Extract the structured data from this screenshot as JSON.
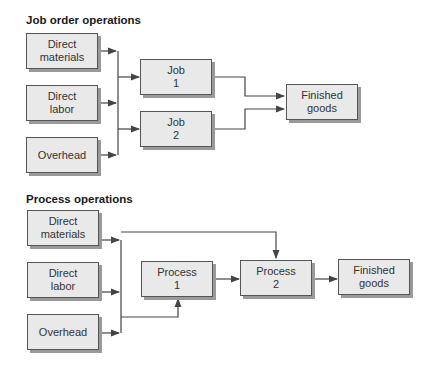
{
  "job_order": {
    "title": "Job order operations",
    "inputs": [
      {
        "line1": "Direct",
        "line2": "materials"
      },
      {
        "line1": "Direct",
        "line2": "labor"
      },
      {
        "line1": "Overhead",
        "line2": ""
      }
    ],
    "jobs": [
      {
        "line1": "Job",
        "line2": "1"
      },
      {
        "line1": "Job",
        "line2": "2"
      }
    ],
    "output": {
      "line1": "Finished",
      "line2": "goods"
    }
  },
  "process": {
    "title": "Process operations",
    "inputs": [
      {
        "line1": "Direct",
        "line2": "materials"
      },
      {
        "line1": "Direct",
        "line2": "labor"
      },
      {
        "line1": "Overhead",
        "line2": ""
      }
    ],
    "processes": [
      {
        "line1": "Process",
        "line2": "1"
      },
      {
        "line1": "Process",
        "line2": "2"
      }
    ],
    "output": {
      "line1": "Finished",
      "line2": "goods"
    }
  }
}
